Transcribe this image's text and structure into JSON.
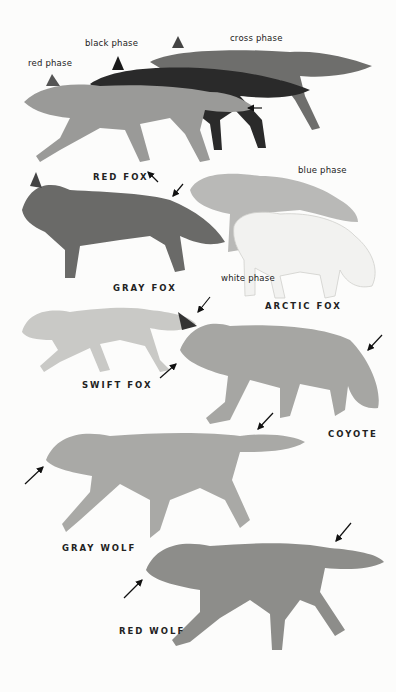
{
  "plate": {
    "background": "#fcfcfb",
    "phase_labels": {
      "red_phase": "red phase",
      "black_phase": "black phase",
      "cross_phase": "cross phase",
      "blue_phase": "blue phase",
      "white_phase": "white phase"
    },
    "species": [
      {
        "name": "RED FOX"
      },
      {
        "name": "GRAY FOX"
      },
      {
        "name": "ARCTIC FOX"
      },
      {
        "name": "SWIFT FOX"
      },
      {
        "name": "COYOTE"
      },
      {
        "name": "GRAY WOLF"
      },
      {
        "name": "RED WOLF"
      }
    ],
    "colors": {
      "red_fox": "#9a9a98",
      "black_fox": "#2a2a2a",
      "cross_fox": "#6e6e6c",
      "gray_fox": "#6a6a68",
      "blue_arctic": "#b9b9b7",
      "white_arctic": "#f2f2f0",
      "swift_fox": "#c9c9c6",
      "coyote": "#a6a6a3",
      "gray_wolf": "#a9a9a6",
      "red_wolf": "#8d8d8a"
    }
  }
}
